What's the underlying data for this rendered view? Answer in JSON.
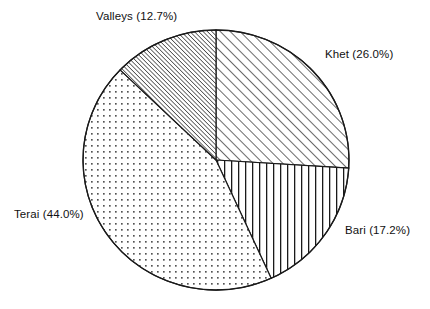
{
  "chart_data": {
    "type": "pie",
    "title": "",
    "subtitle": "",
    "xlabel": "",
    "ylabel": "",
    "legend_position": "none",
    "grid": false,
    "start_angle_deg": 0,
    "direction": "clockwise",
    "categories": [
      "Khet",
      "Bari",
      "Terai",
      "Valleys"
    ],
    "values": [
      26.0,
      17.2,
      44.0,
      12.7
    ],
    "value_unit": "%",
    "labels": [
      "Khet (26.0%)",
      "Bari (17.2%)",
      "Terai (44.0%)",
      "Valleys (12.7%)"
    ],
    "slices": [
      {
        "name": "Khet",
        "label": "Khet (26.0%)",
        "percent": 26.0,
        "start_deg": 0.0,
        "end_deg": 93.6,
        "sweep_deg": 93.6,
        "fill_pattern": "diagonal-hatch-wide",
        "label_position": "right"
      },
      {
        "name": "Bari",
        "label": "Bari (17.2%)",
        "percent": 17.2,
        "start_deg": 93.6,
        "end_deg": 155.5,
        "sweep_deg": 61.9,
        "fill_pattern": "vertical-lines",
        "label_position": "bottom-right"
      },
      {
        "name": "Terai",
        "label": "Terai (44.0%)",
        "percent": 44.0,
        "start_deg": 155.5,
        "end_deg": 313.9,
        "sweep_deg": 158.4,
        "fill_pattern": "dots",
        "label_position": "left"
      },
      {
        "name": "Valleys",
        "label": "Valleys (12.7%)",
        "percent": 12.7,
        "start_deg": 313.9,
        "end_deg": 360.0,
        "sweep_deg": 46.1,
        "fill_pattern": "diagonal-hatch-dense",
        "label_position": "top"
      }
    ],
    "geometry": {
      "center_x": 216,
      "center_y": 160,
      "radius_x": 133,
      "radius_y": 130
    },
    "colors": {
      "background": "#ffffff",
      "outline": "#1a1a1a",
      "pattern": "#1a1a1a",
      "text": "#111111"
    }
  }
}
